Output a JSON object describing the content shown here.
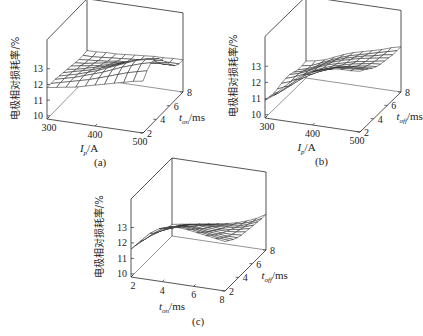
{
  "figure": {
    "panels": [
      {
        "id": "a",
        "caption": "(a)"
      },
      {
        "id": "b",
        "caption": "(b)"
      },
      {
        "id": "c",
        "caption": "(c)"
      }
    ]
  },
  "chart_data": [
    {
      "type": "surface",
      "panel": "(a)",
      "title": "",
      "zlabel": "电极相对损耗率/%",
      "xlabel": "I_p/A",
      "ylabel": "t_on/ms",
      "x_ticks": [
        300,
        400,
        500
      ],
      "y_ticks": [
        2,
        4,
        6,
        8
      ],
      "z_ticks": [
        10,
        11,
        12,
        13
      ],
      "xlim": [
        300,
        500
      ],
      "ylim": [
        2,
        8
      ],
      "zlim": [
        9.8,
        14
      ],
      "grid": false,
      "x": [
        300,
        320,
        340,
        360,
        380,
        400,
        420,
        440,
        460,
        480,
        500
      ],
      "y": [
        2,
        2.6,
        3.2,
        3.8,
        4.4,
        5,
        5.6,
        6.2,
        6.8,
        7.4,
        8
      ],
      "z_description": "Surface ~11.8 at low I_p; peaks near 13.8 at I_p≈300-340A, t_on≈8ms; folds down to ~11.6-12 at high I_p (500A)",
      "z": [
        [
          11.8,
          11.9,
          12.0,
          12.1,
          12.25,
          12.4,
          12.55,
          12.7,
          12.85,
          13.0,
          13.1
        ],
        [
          11.8,
          11.95,
          12.1,
          12.25,
          12.4,
          12.6,
          12.8,
          13.0,
          13.2,
          13.35,
          13.5
        ],
        [
          11.8,
          11.95,
          12.1,
          12.3,
          12.5,
          12.7,
          12.95,
          13.2,
          13.4,
          13.6,
          13.75
        ],
        [
          11.75,
          11.9,
          12.05,
          12.25,
          12.45,
          12.7,
          12.95,
          13.2,
          13.45,
          13.6,
          13.7
        ],
        [
          11.7,
          11.85,
          12.0,
          12.15,
          12.35,
          12.55,
          12.8,
          13.05,
          13.25,
          13.4,
          13.5
        ],
        [
          11.65,
          11.75,
          11.9,
          12.05,
          12.2,
          12.4,
          12.6,
          12.8,
          12.95,
          13.05,
          13.1
        ],
        [
          11.6,
          11.7,
          11.8,
          11.9,
          12.05,
          12.2,
          12.35,
          12.5,
          12.6,
          12.65,
          12.7
        ],
        [
          11.55,
          11.6,
          11.7,
          11.8,
          11.9,
          12.0,
          12.1,
          12.2,
          12.25,
          12.3,
          12.3
        ],
        [
          11.5,
          11.55,
          11.6,
          11.65,
          11.75,
          11.8,
          11.9,
          11.95,
          12.0,
          12.0,
          12.0
        ],
        [
          11.5,
          11.5,
          11.55,
          11.6,
          11.65,
          11.7,
          11.75,
          11.8,
          11.85,
          11.85,
          11.85
        ],
        [
          11.55,
          11.55,
          11.6,
          11.6,
          11.65,
          11.7,
          11.75,
          11.8,
          11.8,
          11.85,
          11.85
        ]
      ]
    },
    {
      "type": "surface",
      "panel": "(b)",
      "title": "",
      "zlabel": "电极相对损耗率/%",
      "xlabel": "I_p/A",
      "ylabel": "t_off/ms",
      "x_ticks": [
        300,
        400,
        500
      ],
      "y_ticks": [
        2,
        4,
        6,
        8
      ],
      "z_ticks": [
        10,
        11,
        12,
        13
      ],
      "xlim": [
        300,
        500
      ],
      "ylim": [
        2,
        8
      ],
      "zlim": [
        9.8,
        14
      ],
      "grid": false,
      "x": [
        300,
        320,
        340,
        360,
        380,
        400,
        420,
        440,
        460,
        480,
        500
      ],
      "y": [
        2,
        2.6,
        3.2,
        3.8,
        4.4,
        5,
        5.6,
        6.2,
        6.8,
        7.4,
        8
      ],
      "z_description": "Wavy saddle surface; ~10.8 at front-left (300A, 2ms), rises to ~13.5 at back-left (300A, 8ms), ~10.8-11 at front-right (500A,2ms), ~12.8 at back-right",
      "z": [
        [
          10.9,
          11.3,
          11.9,
          12.4,
          12.8,
          13.1,
          13.3,
          13.45,
          13.5,
          13.5,
          13.55
        ],
        [
          10.85,
          11.2,
          11.7,
          12.2,
          12.6,
          12.9,
          13.1,
          13.25,
          13.3,
          13.35,
          13.4
        ],
        [
          10.8,
          11.1,
          11.55,
          12.0,
          12.35,
          12.65,
          12.85,
          13.0,
          13.1,
          13.15,
          13.2
        ],
        [
          10.85,
          11.1,
          11.5,
          11.9,
          12.2,
          12.45,
          12.65,
          12.8,
          12.9,
          12.95,
          13.0
        ],
        [
          10.95,
          11.15,
          11.45,
          11.8,
          12.1,
          12.3,
          12.5,
          12.6,
          12.7,
          12.8,
          12.85
        ],
        [
          11.0,
          11.2,
          11.45,
          11.75,
          12.0,
          12.2,
          12.35,
          12.5,
          12.6,
          12.7,
          12.75
        ],
        [
          11.0,
          11.15,
          11.4,
          11.7,
          11.95,
          12.1,
          12.25,
          12.4,
          12.5,
          12.6,
          12.7
        ],
        [
          10.9,
          11.05,
          11.3,
          11.6,
          11.85,
          12.05,
          12.2,
          12.35,
          12.45,
          12.55,
          12.65
        ],
        [
          10.8,
          10.95,
          11.2,
          11.5,
          11.75,
          11.95,
          12.1,
          12.25,
          12.35,
          12.5,
          12.6
        ],
        [
          10.8,
          10.9,
          11.15,
          11.4,
          11.65,
          11.85,
          12.0,
          12.15,
          12.3,
          12.45,
          12.6
        ],
        [
          10.85,
          10.95,
          11.1,
          11.35,
          11.6,
          11.8,
          11.95,
          12.1,
          12.25,
          12.45,
          12.6
        ]
      ]
    },
    {
      "type": "surface",
      "panel": "(c)",
      "title": "",
      "zlabel": "电极相对损耗率/%",
      "xlabel": "t_on/ms",
      "ylabel": "t_off/ms",
      "x_ticks": [
        2,
        4,
        6,
        8
      ],
      "y_ticks": [
        2,
        4,
        6,
        8
      ],
      "z_ticks": [
        10,
        11,
        12,
        13
      ],
      "xlim": [
        2,
        8
      ],
      "ylim": [
        2,
        8
      ],
      "zlim": [
        9.8,
        14
      ],
      "grid": false,
      "x": [
        2,
        2.6,
        3.2,
        3.8,
        4.4,
        5,
        5.6,
        6.2,
        6.8,
        7.4,
        8
      ],
      "y": [
        2,
        2.6,
        3.2,
        3.8,
        4.4,
        5,
        5.6,
        6.2,
        6.8,
        7.4,
        8
      ],
      "z_description": "Wavy surface; ~11.6 at front-left (t_on=2,t_off=2), rising to ~13.5 at back-left (t_on=2, t_off=8); dips to ~10.6 at front-right (t_on=8,t_off=2); ~12.6 at back-right",
      "z": [
        [
          11.6,
          12.2,
          12.8,
          13.2,
          13.4,
          13.45,
          13.4,
          13.3,
          13.2,
          13.1,
          13.0
        ],
        [
          11.55,
          12.05,
          12.55,
          12.95,
          13.15,
          13.2,
          13.15,
          13.05,
          12.95,
          12.85,
          12.8
        ],
        [
          11.5,
          11.95,
          12.35,
          12.7,
          12.9,
          12.95,
          12.9,
          12.8,
          12.7,
          12.65,
          12.6
        ],
        [
          11.45,
          11.85,
          12.2,
          12.45,
          12.65,
          12.7,
          12.65,
          12.55,
          12.5,
          12.45,
          12.45
        ],
        [
          11.4,
          11.75,
          12.0,
          12.25,
          12.4,
          12.45,
          12.4,
          12.35,
          12.3,
          12.3,
          12.35
        ],
        [
          11.3,
          11.6,
          11.85,
          12.05,
          12.2,
          12.25,
          12.2,
          12.15,
          12.15,
          12.2,
          12.3
        ],
        [
          11.15,
          11.4,
          11.65,
          11.85,
          11.95,
          12.0,
          12.0,
          11.95,
          12.0,
          12.1,
          12.25
        ],
        [
          10.95,
          11.2,
          11.4,
          11.6,
          11.7,
          11.75,
          11.75,
          11.8,
          11.85,
          12.0,
          12.2
        ],
        [
          10.75,
          10.95,
          11.15,
          11.3,
          11.4,
          11.5,
          11.55,
          11.6,
          11.7,
          11.9,
          12.15
        ],
        [
          10.6,
          10.75,
          10.9,
          11.05,
          11.15,
          11.25,
          11.35,
          11.45,
          11.6,
          11.8,
          12.1
        ],
        [
          10.55,
          10.65,
          10.75,
          10.85,
          10.95,
          11.05,
          11.15,
          11.3,
          11.5,
          11.75,
          12.1
        ]
      ]
    }
  ],
  "labels": {
    "zlabel": "电极相对损耗率/%",
    "a": {
      "xlabel_main": "I",
      "xlabel_sub": "p",
      "xlabel_unit": "/A",
      "ylabel_main": "t",
      "ylabel_sub": "on",
      "ylabel_unit": "/ms"
    },
    "b": {
      "xlabel_main": "I",
      "xlabel_sub": "p",
      "xlabel_unit": "/A",
      "ylabel_main": "t",
      "ylabel_sub": "off",
      "ylabel_unit": "/ms"
    },
    "c": {
      "xlabel_main": "t",
      "xlabel_sub": "on",
      "xlabel_unit": "/ms",
      "ylabel_main": "t",
      "ylabel_sub": "off",
      "ylabel_unit": "/ms"
    }
  },
  "style": {
    "line_color": "#2a2a2a",
    "surface_fill": "#ffffff",
    "background": "#ffffff"
  }
}
